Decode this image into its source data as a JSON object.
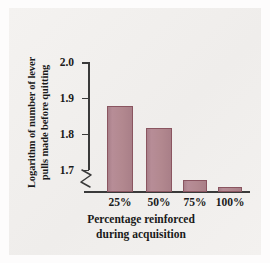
{
  "chart_data": {
    "type": "bar",
    "title": "",
    "categories": [
      "25%",
      "50%",
      "75%",
      "100%"
    ],
    "values": [
      1.88,
      1.82,
      1.675,
      1.655
    ],
    "xlabel": "Percentage reinforced during acquisition",
    "xlabel_lines": [
      "Percentage reinforced",
      "during acquisition"
    ],
    "ylabel": "Logarithm of number of lever pulls made before quitting",
    "ylabel_lines": [
      "Logarithm of number of lever",
      "pulls made before quitting"
    ],
    "ylim": [
      1.64,
      2.0
    ],
    "yticks": [
      "2.0",
      "1.9",
      "1.8",
      "1.7"
    ],
    "ytick_values": [
      2.0,
      1.9,
      1.8,
      1.7
    ],
    "axis_break": true,
    "grid": false,
    "legend": null,
    "colors": {
      "bar_fill": "#b1868f",
      "bar_border": "#8a5560",
      "axis": "#3a3a3a",
      "text": "#1a1a1a",
      "panel_background": "#f2f0ee",
      "figure_background": "#fdfcfc"
    }
  }
}
